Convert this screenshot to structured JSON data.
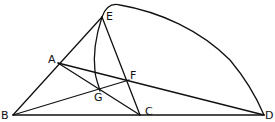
{
  "diagram": {
    "type": "geometric-construction",
    "points": {
      "A": {
        "label": "A",
        "x": 58,
        "y": 63
      },
      "B": {
        "label": "B",
        "x": 13,
        "y": 115
      },
      "C": {
        "label": "C",
        "x": 140,
        "y": 115
      },
      "D": {
        "label": "D",
        "x": 264,
        "y": 115
      },
      "E": {
        "label": "E",
        "x": 102,
        "y": 17
      },
      "F": {
        "label": "F",
        "x": 129,
        "y": 80
      },
      "G": {
        "label": "G",
        "x": 100,
        "y": 91
      }
    },
    "labels": {
      "A": "A",
      "B": "B",
      "C": "C",
      "D": "D",
      "E": "E",
      "F": "F",
      "G": "G"
    },
    "segments": [
      "B-D",
      "B-E",
      "E-C",
      "A-C",
      "A-D",
      "B-F"
    ],
    "curves": [
      "E-D arc (upper)",
      "E-G arc"
    ],
    "stroke_color": "#111111",
    "background_color": "#ffffff"
  }
}
